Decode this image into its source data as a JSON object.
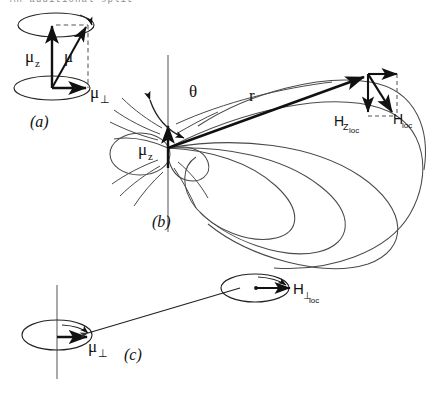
{
  "figure": {
    "title_fragment": "An additional split",
    "background_color": "#ffffff",
    "ink_color": "#111111",
    "field_line_color": "#4a4a4a",
    "panels": [
      {
        "id": "a",
        "tag": "(a)",
        "description": "Magnetic moment decomposed into axial and perpendicular components with precession cones",
        "labels": [
          {
            "name": "mu-z",
            "text": "μ",
            "sub": "z"
          },
          {
            "name": "mu-total",
            "text": "μ",
            "sub": ""
          },
          {
            "name": "mu-perp",
            "text": "μ",
            "sub": "⊥"
          }
        ]
      },
      {
        "id": "b",
        "tag": "(b)",
        "description": "Dipole field of the axial moment with local field decomposition at the field point",
        "labels": [
          {
            "name": "mu-z",
            "text": "μ",
            "sub": "z"
          },
          {
            "name": "theta",
            "text": "θ",
            "sub": ""
          },
          {
            "name": "r-distance",
            "text": "r",
            "sub": ""
          },
          {
            "name": "h-z-loc",
            "text": "H",
            "sub": "Z",
            "sub2": "loc"
          },
          {
            "name": "h-loc",
            "text": "H",
            "sub": "loc"
          }
        ]
      },
      {
        "id": "c",
        "tag": "(c)",
        "description": "Perpendicular moment and the perpendicular local field at a distant site",
        "labels": [
          {
            "name": "mu-perp",
            "text": "μ",
            "sub": "⊥"
          },
          {
            "name": "h-perp-loc",
            "text": "H",
            "sub": "⊥",
            "sub2": "loc"
          }
        ]
      }
    ]
  }
}
